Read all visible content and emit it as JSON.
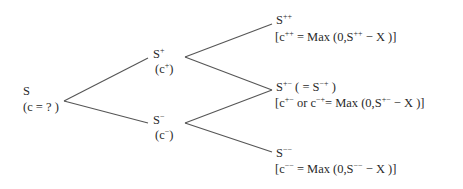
{
  "diagram": {
    "type": "binomial-tree",
    "line_color": "#555555",
    "nodes": {
      "root": {
        "price": "S",
        "value": "(c = ? )"
      },
      "up": {
        "price_base": "S",
        "price_sup": "+",
        "value_open": "(c",
        "value_sup": "+",
        "value_close": ")"
      },
      "down": {
        "price_base": "S",
        "price_sup": "−",
        "value_open": "(c",
        "value_sup": "−",
        "value_close": ")"
      },
      "up_up": {
        "price_base": "S",
        "price_sup": "++",
        "formula": {
          "p1": "[c",
          "s1": "++",
          "p2": " = Max (0,S",
          "s2": "++",
          "p3": " −  X )]"
        }
      },
      "up_down": {
        "price_base": "S",
        "price_sup": "+−",
        "alias_open": "  ( = S",
        "alias_sup": "−+",
        "alias_close": " )",
        "formula": {
          "p1": "[c",
          "s1": "+−",
          "p2": " or c",
          "s2": "−+",
          "p3": "= Max (0,S",
          "s3": "+−",
          "p4": " −  X )]"
        }
      },
      "down_down": {
        "price_base": "S",
        "price_sup": "−−",
        "formula": {
          "p1": "[c",
          "s1": "−−",
          "p2": " = Max (0,S",
          "s2": "−−",
          "p3": " −  X )]"
        }
      }
    }
  }
}
